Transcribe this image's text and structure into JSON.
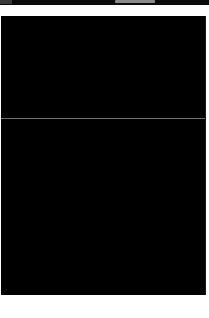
{
  "window": {
    "title": ""
  },
  "top_strip": {
    "indicator": "progress-indicator",
    "colors": {
      "background": "#0a0a0a",
      "indicator": "#8a8a8a"
    }
  },
  "viewport": {
    "panes": [
      {
        "name": "upper-pane",
        "content": ""
      },
      {
        "name": "lower-pane",
        "content": ""
      }
    ],
    "colors": {
      "background": "#000000",
      "divider": "#6e6e6e"
    }
  },
  "colors": {
    "frame": "#ffffff"
  }
}
